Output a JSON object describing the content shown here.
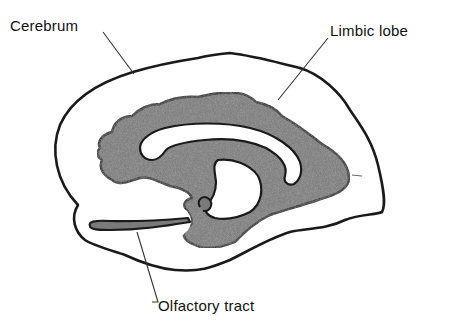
{
  "diagram": {
    "type": "anatomical-illustration",
    "labels": {
      "cerebrum": "Cerebrum",
      "limbic_lobe": "Limbic lobe",
      "olfactory_tract": "Olfactory tract"
    },
    "colors": {
      "background": "#ffffff",
      "outline": "#1a1a1a",
      "limbic_fill": "#7a7a7a",
      "leader_line": "#333333",
      "text": "#111111"
    }
  }
}
